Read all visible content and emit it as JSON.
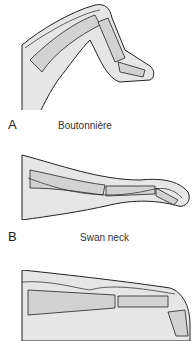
{
  "figure": {
    "panels": [
      {
        "letter": "A",
        "caption": "Boutonnière"
      },
      {
        "letter": "B",
        "caption": "Swan neck"
      },
      {
        "letter": "",
        "caption": ""
      }
    ],
    "colors": {
      "skin": "#e6e6e6",
      "bone": "#d2d2d2",
      "outline": "#222222"
    }
  }
}
